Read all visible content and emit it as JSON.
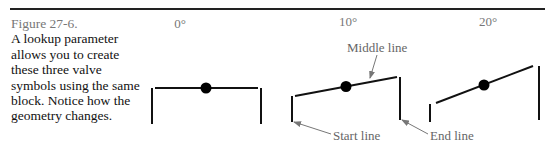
{
  "caption": {
    "figure_number": "Figure 27-6.",
    "text": "A lookup parameter allows you to create these three valve symbols using the same block. Notice how the geometry changes."
  },
  "symbols": [
    {
      "angle_label": "0°"
    },
    {
      "angle_label": "10°"
    },
    {
      "angle_label": "20°"
    }
  ],
  "callouts": {
    "middle_line": "Middle line",
    "start_line": "Start line",
    "end_line": "End line"
  }
}
